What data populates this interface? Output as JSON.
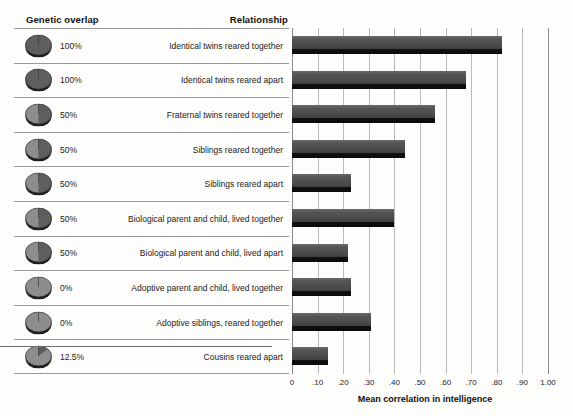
{
  "header": {
    "genetic_overlap": "Genetic overlap",
    "relationship": "Relationship"
  },
  "rows": [
    {
      "overlap": "100%",
      "overlap_value": 100,
      "relationship": "Identical twins reared together",
      "correlation": 0.82
    },
    {
      "overlap": "100%",
      "overlap_value": 100,
      "relationship": "Identical twins reared apart",
      "correlation": 0.68
    },
    {
      "overlap": "50%",
      "overlap_value": 50,
      "relationship": "Fraternal twins reared together",
      "correlation": 0.56
    },
    {
      "overlap": "50%",
      "overlap_value": 50,
      "relationship": "Siblings reared together",
      "correlation": 0.44
    },
    {
      "overlap": "50%",
      "overlap_value": 50,
      "relationship": "Siblings reared apart",
      "correlation": 0.23
    },
    {
      "overlap": "50%",
      "overlap_value": 50,
      "relationship": "Biological parent and child, lived together",
      "correlation": 0.4
    },
    {
      "overlap": "50%",
      "overlap_value": 50,
      "relationship": "Biological parent and child, lived apart",
      "correlation": 0.22
    },
    {
      "overlap": "0%",
      "overlap_value": 0,
      "relationship": "Adoptive parent and child, lived together",
      "correlation": 0.23
    },
    {
      "overlap": "0%",
      "overlap_value": 0,
      "relationship": "Adoptive siblings, reared together",
      "correlation": 0.31
    },
    {
      "overlap": "12.5%",
      "overlap_value": 12.5,
      "relationship": "Cousins reared apart",
      "correlation": 0.14
    }
  ],
  "axis": {
    "title": "Mean correlation in intelligence",
    "ticks": [
      "0",
      ".10",
      ".20",
      ".30",
      ".40",
      ".50",
      ".60",
      ".70",
      ".80",
      ".90",
      "1.00"
    ],
    "min": 0,
    "max": 1.0
  },
  "colors": {
    "bar": "#4a4a4a",
    "bar_shadow": "#0a0a0a",
    "gridline": "#b9b9b9",
    "rule": "#9a9a9a",
    "text": "#1b1b1b",
    "background": "#fdfdfb"
  },
  "chart_data": {
    "type": "bar",
    "orientation": "horizontal",
    "title": "",
    "xlabel": "Mean correlation in intelligence",
    "ylabel": "Relationship",
    "xlim": [
      0,
      1.0
    ],
    "xticks": [
      0,
      0.1,
      0.2,
      0.3,
      0.4,
      0.5,
      0.6,
      0.7,
      0.8,
      0.9,
      1.0
    ],
    "grid": true,
    "legend": false,
    "categories": [
      "Identical twins reared together",
      "Identical twins reared apart",
      "Fraternal twins reared together",
      "Siblings reared together",
      "Siblings reared apart",
      "Biological parent and child, lived together",
      "Biological parent and child, lived apart",
      "Adoptive parent and child, lived together",
      "Adoptive siblings, reared together",
      "Cousins reared apart"
    ],
    "values": [
      0.82,
      0.68,
      0.56,
      0.44,
      0.23,
      0.4,
      0.22,
      0.23,
      0.31,
      0.14
    ],
    "genetic_overlap_percent": [
      100,
      100,
      50,
      50,
      50,
      50,
      50,
      0,
      0,
      12.5
    ]
  }
}
